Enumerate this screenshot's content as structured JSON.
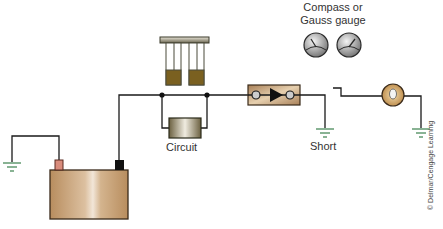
{
  "diagram": {
    "labels": {
      "gauge_title_line1": "Compass or",
      "gauge_title_line2": "Gauss gauge",
      "circuit": "Circuit",
      "short": "Short",
      "copyright": "© Delmar/Cengage Learning"
    },
    "components": [
      {
        "id": "battery",
        "type": "battery",
        "terminals": [
          "positive",
          "negative"
        ]
      },
      {
        "id": "ground-left",
        "type": "ground"
      },
      {
        "id": "circuit-breaker-tool",
        "type": "short-finder-breaker"
      },
      {
        "id": "circuit",
        "type": "circuit-protection-device"
      },
      {
        "id": "inline-device",
        "type": "diode-block"
      },
      {
        "id": "ground-short",
        "type": "ground"
      },
      {
        "id": "switch",
        "type": "open-switch"
      },
      {
        "id": "lamp",
        "type": "lamp"
      },
      {
        "id": "ground-right",
        "type": "ground"
      },
      {
        "id": "gauge-1",
        "type": "compass-gauge"
      },
      {
        "id": "gauge-2",
        "type": "compass-gauge"
      }
    ],
    "colors": {
      "wire": "#1a1a1a",
      "ground": "#4a8a5a",
      "battery_body": "#c9a57a",
      "battery_positive": "#d98c7c",
      "battery_negative": "#111111",
      "component_tan": "#c8a070",
      "breaker_fill": "#7a6020",
      "gauge": "#9a9a9a",
      "lamp_ring": "#c09050",
      "text": "#333333"
    }
  }
}
